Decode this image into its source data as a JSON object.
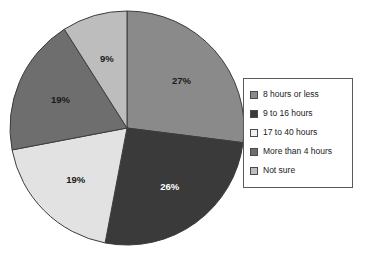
{
  "chart_data": {
    "type": "pie",
    "title": "",
    "subtitle": "",
    "xlabel": "",
    "ylabel": "",
    "legend_position": "right",
    "grid": false,
    "start_angle_deg": 0,
    "direction": "clockwise",
    "categories": [
      "8 hours or less",
      "9 to 16 hours",
      "17 to 40 hours",
      "More than 4 hours",
      "Not sure"
    ],
    "values": [
      27,
      26,
      19,
      19,
      9
    ],
    "value_labels": [
      "27%",
      "26%",
      "19%",
      "19%",
      "9%"
    ],
    "colors": [
      "#8a8a8a",
      "#3a3a3a",
      "#e2e2e2",
      "#6e6e6e",
      "#bdbdbd"
    ],
    "label_text_colors": [
      "#1a1a1a",
      "#ffffff",
      "#1a1a1a",
      "#1a1a1a",
      "#1a1a1a"
    ],
    "slices": [
      {
        "label": "8 hours or less",
        "value": 27,
        "value_label": "27%",
        "color": "#8a8a8a",
        "label_color": "#1a1a1a"
      },
      {
        "label": "9 to 16 hours",
        "value": 26,
        "value_label": "26%",
        "color": "#3a3a3a",
        "label_color": "#ffffff"
      },
      {
        "label": "17 to 40 hours",
        "value": 19,
        "value_label": "19%",
        "color": "#e2e2e2",
        "label_color": "#1a1a1a"
      },
      {
        "label": "More than 4 hours",
        "value": 19,
        "value_label": "19%",
        "color": "#6e6e6e",
        "label_color": "#1a1a1a"
      },
      {
        "label": "Not sure",
        "value": 9,
        "value_label": "9%",
        "color": "#bdbdbd",
        "label_color": "#1a1a1a"
      }
    ]
  },
  "pie": {
    "center_x": 119,
    "center_y": 118,
    "radius": 117,
    "outline_color": "#3d3d3d"
  },
  "legend": {
    "border_color": "#5a5a5a",
    "items": [
      {
        "label": "8 hours or less",
        "color": "#8a8a8a"
      },
      {
        "label": "9 to 16 hours",
        "color": "#3a3a3a"
      },
      {
        "label": "17 to 40 hours",
        "color": "#f0f0f0"
      },
      {
        "label": "More than 4 hours",
        "color": "#6e6e6e"
      },
      {
        "label": "Not sure",
        "color": "#bdbdbd"
      }
    ]
  }
}
